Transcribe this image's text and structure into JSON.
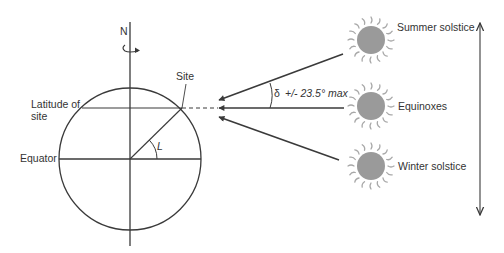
{
  "diagram": {
    "labels": {
      "north": "N",
      "site": "Site",
      "latitude_line1": "Latitude of",
      "latitude_line2": "site",
      "equator": "Equator",
      "angle_latitude": "L",
      "declination_symbol": "δ",
      "declination_text": "+/- 23.5° max",
      "summer": "Summer solstice",
      "equinox": "Equinoxes",
      "winter": "Winter solstice"
    },
    "colors": {
      "line": "#3a3a3a",
      "sun_fill": "#9a9a9a",
      "sun_rays": "#a8a8a8",
      "text": "#333333"
    },
    "icons": {
      "rotation": "rotation-arrow-icon",
      "sun": "sun-icon",
      "range_arrow": "double-headed-arrow-icon"
    }
  }
}
